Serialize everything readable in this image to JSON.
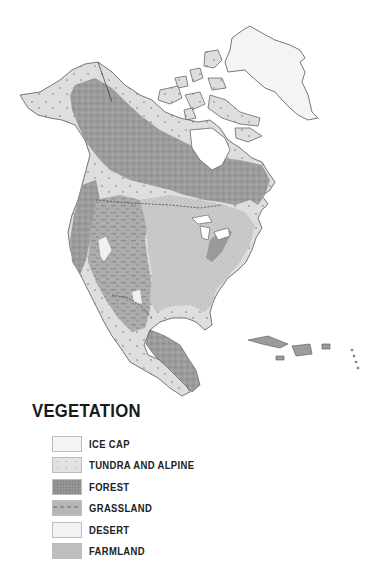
{
  "map": {
    "region": "North America",
    "colors": {
      "ice_cap": "#f4f4f4",
      "tundra": "#dedede",
      "forest": "#9a9a9a",
      "grassland": "#b3b3b3",
      "desert": "#f0f0f0",
      "farmland": "#c8c8c8",
      "coast": "#555555",
      "water": "#ffffff"
    }
  },
  "legend": {
    "title": "VEGETATION",
    "items": [
      {
        "label": "ICE CAP",
        "color": "#f4f4f4",
        "pattern": "plain"
      },
      {
        "label": "TUNDRA AND ALPINE",
        "color": "#e2e2e2",
        "pattern": "v-marks"
      },
      {
        "label": "FOREST",
        "color": "#9a9a9a",
        "pattern": "mottled"
      },
      {
        "label": "GRASSLAND",
        "color": "#b5b5b5",
        "pattern": "dashes"
      },
      {
        "label": "DESERT",
        "color": "#f2f2f2",
        "pattern": "plain"
      },
      {
        "label": "FARMLAND",
        "color": "#c9c9c9",
        "pattern": "stipple"
      }
    ]
  }
}
